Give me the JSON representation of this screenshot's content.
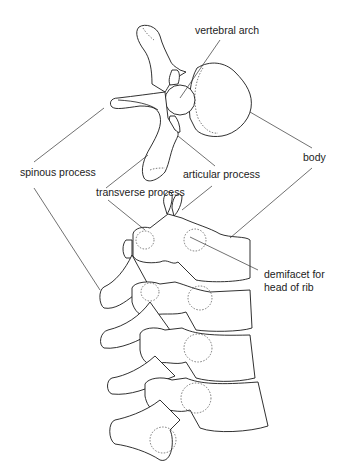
{
  "diagram": {
    "labels": {
      "vertebral_arch": "vertebral arch",
      "spinous_process": "spinous process",
      "transverse_process": "transverse process",
      "articular_process": "articular process",
      "body": "body",
      "demifacet_line1": "demifacet for",
      "demifacet_line2": "head of rib"
    },
    "colors": {
      "stroke": "#1a1a1a",
      "background": "#ffffff",
      "text": "#222222"
    }
  }
}
